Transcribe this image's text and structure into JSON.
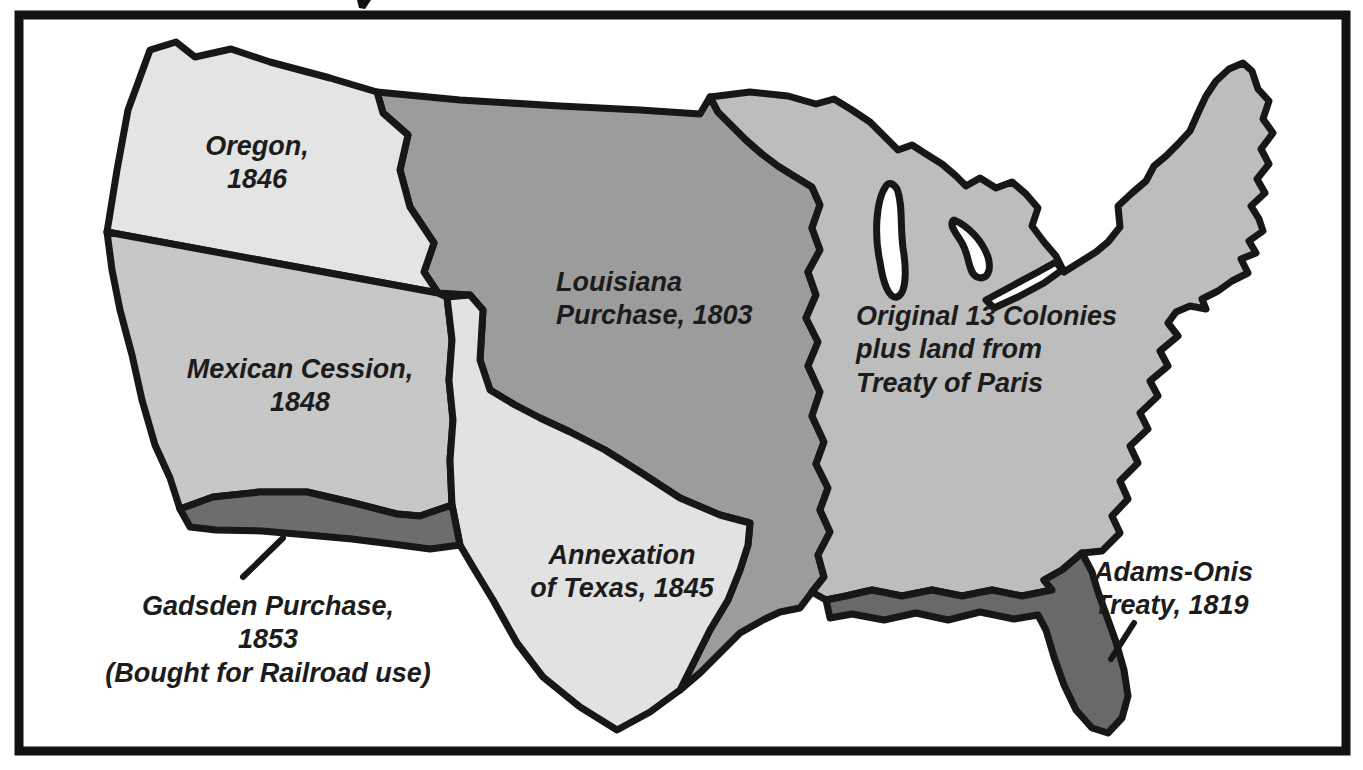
{
  "page": {
    "background_color": "#ffffff",
    "frame_color": "#121212"
  },
  "map": {
    "outline_color": "#171717",
    "water_color": "#ffffff",
    "label_color": "#1c1c1c",
    "regions": [
      {
        "id": "oregon",
        "label": "Oregon, 1846",
        "label_lines": [
          "Oregon,",
          "1846"
        ],
        "color": "#e4e4e4"
      },
      {
        "id": "mexican-cession",
        "label": "Mexican Cession, 1848",
        "label_lines": [
          "Mexican Cession,",
          "1848"
        ],
        "color": "#c7c7c7"
      },
      {
        "id": "gadsden-purchase",
        "label": "Gadsden Purchase, 1853 (Bought for Railroad use)",
        "label_lines": [
          "Gadsden Purchase,",
          "1853",
          "(Bought for Railroad use)"
        ],
        "color": "#6d6d6d"
      },
      {
        "id": "annexation-of-texas",
        "label": "Annexation of Texas, 1845",
        "label_lines": [
          "Annexation",
          "of Texas, 1845"
        ],
        "color": "#e2e2e2"
      },
      {
        "id": "louisiana-purchase",
        "label": "Louisiana Purchase, 1803",
        "label_lines": [
          "Louisiana",
          "Purchase, 1803"
        ],
        "color": "#9c9c9c"
      },
      {
        "id": "original-13-colonies",
        "label": "Original 13 Colonies plus land from Treaty of Paris",
        "label_lines": [
          "Original 13 Colonies",
          "plus land from",
          "Treaty of Paris"
        ],
        "color": "#bdbdbd"
      },
      {
        "id": "adams-onis-treaty",
        "label": "Adams-Onis Treaty, 1819",
        "label_lines": [
          "Adams-Onis",
          "Treaty, 1819"
        ],
        "color": "#696969"
      }
    ]
  }
}
